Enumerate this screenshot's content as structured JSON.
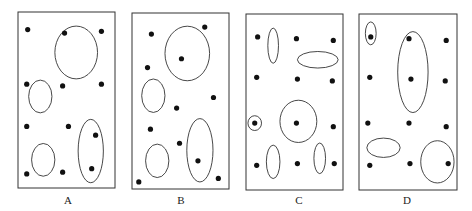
{
  "panels": [
    {
      "label": "A",
      "dots": [
        [
          0.1,
          0.1
        ],
        [
          0.48,
          0.12
        ],
        [
          0.86,
          0.11
        ],
        [
          0.09,
          0.41
        ],
        [
          0.46,
          0.42
        ],
        [
          0.86,
          0.41
        ],
        [
          0.09,
          0.65
        ],
        [
          0.52,
          0.65
        ],
        [
          0.8,
          0.7
        ],
        [
          0.09,
          0.92
        ],
        [
          0.46,
          0.91
        ],
        [
          0.76,
          0.89
        ]
      ],
      "ellipses": [
        [
          0.6,
          0.23,
          0.22,
          0.15
        ],
        [
          0.23,
          0.48,
          0.12,
          0.093
        ],
        [
          0.26,
          0.84,
          0.12,
          0.093
        ],
        [
          0.75,
          0.79,
          0.13,
          0.18
        ]
      ]
    },
    {
      "label": "B",
      "dots": [
        [
          0.2,
          0.12
        ],
        [
          0.75,
          0.08
        ],
        [
          0.51,
          0.26
        ],
        [
          0.16,
          0.31
        ],
        [
          0.84,
          0.48
        ],
        [
          0.46,
          0.54
        ],
        [
          0.19,
          0.66
        ],
        [
          0.49,
          0.74
        ],
        [
          0.68,
          0.84
        ],
        [
          0.07,
          0.96
        ],
        [
          0.89,
          0.94
        ]
      ],
      "ellipses": [
        [
          0.57,
          0.23,
          0.23,
          0.155
        ],
        [
          0.22,
          0.47,
          0.12,
          0.095
        ],
        [
          0.26,
          0.84,
          0.12,
          0.095
        ],
        [
          0.7,
          0.78,
          0.135,
          0.18
        ]
      ]
    },
    {
      "label": "C",
      "dots": [
        [
          0.12,
          0.13
        ],
        [
          0.52,
          0.14
        ],
        [
          0.9,
          0.15
        ],
        [
          0.11,
          0.36
        ],
        [
          0.53,
          0.37
        ],
        [
          0.89,
          0.38
        ],
        [
          0.09,
          0.62
        ],
        [
          0.52,
          0.62
        ],
        [
          0.9,
          0.64
        ],
        [
          0.11,
          0.86
        ],
        [
          0.53,
          0.85
        ],
        [
          0.91,
          0.85
        ]
      ],
      "ellipses": [
        [
          0.28,
          0.18,
          0.055,
          0.1
        ],
        [
          0.74,
          0.26,
          0.21,
          0.047
        ],
        [
          0.09,
          0.62,
          0.07,
          0.042
        ],
        [
          0.54,
          0.61,
          0.19,
          0.12
        ],
        [
          0.28,
          0.84,
          0.07,
          0.095
        ],
        [
          0.76,
          0.82,
          0.06,
          0.087
        ]
      ]
    },
    {
      "label": "D",
      "dots": [
        [
          0.12,
          0.13
        ],
        [
          0.51,
          0.14
        ],
        [
          0.89,
          0.15
        ],
        [
          0.11,
          0.36
        ],
        [
          0.53,
          0.37
        ],
        [
          0.88,
          0.38
        ],
        [
          0.09,
          0.62
        ],
        [
          0.51,
          0.62
        ],
        [
          0.89,
          0.64
        ],
        [
          0.11,
          0.86
        ],
        [
          0.52,
          0.85
        ],
        [
          0.91,
          0.85
        ]
      ],
      "ellipses": [
        [
          0.12,
          0.11,
          0.055,
          0.065
        ],
        [
          0.55,
          0.33,
          0.155,
          0.23
        ],
        [
          0.25,
          0.76,
          0.17,
          0.055
        ],
        [
          0.8,
          0.84,
          0.17,
          0.12
        ]
      ]
    }
  ]
}
